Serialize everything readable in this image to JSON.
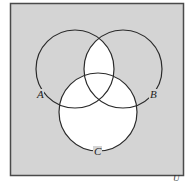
{
  "diagram": {
    "type": "venn",
    "sets": [
      {
        "id": "A",
        "label": "A",
        "cx": 75,
        "cy": 69,
        "r": 39
      },
      {
        "id": "B",
        "label": "B",
        "cx": 123,
        "cy": 69,
        "r": 39
      },
      {
        "id": "C",
        "label": "C",
        "cx": 98,
        "cy": 112,
        "r": 39
      }
    ],
    "universe_label": "U",
    "shaded_region": "(A ∩ B) ∪ C",
    "colors": {
      "background": "#d4d4d4",
      "highlight": "#ffffff",
      "stroke": "#2a2a2a",
      "frame": "#4a4a4a"
    }
  }
}
